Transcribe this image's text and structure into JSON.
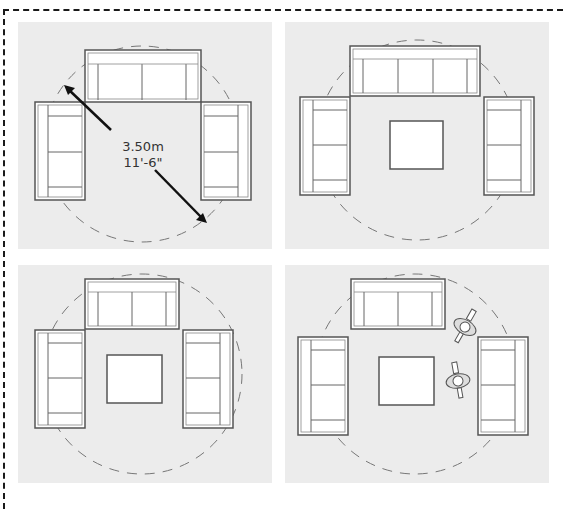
{
  "diagram": {
    "colors": {
      "panel_bg": "#ececec",
      "furniture_fill": "#ffffff",
      "furniture_stroke": "#555555",
      "circle_stroke": "#777777",
      "arrow": "#111111"
    },
    "panels": [
      {
        "id": "layout-1",
        "description": "Sofa with two side sofas, conversation circle with diameter dimension",
        "has_table": false,
        "has_people": false
      },
      {
        "id": "layout-2",
        "description": "Three-seat sofa, two side sofas, square coffee table",
        "has_table": true,
        "has_people": false
      },
      {
        "id": "layout-3",
        "description": "Two-seat sofa, two side sofas, square coffee table",
        "has_table": true,
        "has_people": true
      },
      {
        "id": "layout-4",
        "description": "Sofa, two side sofas offset, coffee table, two people walking through",
        "has_table": true,
        "has_people": true
      }
    ],
    "dimension": {
      "metric": "3.50m",
      "imperial": "11'-6\""
    }
  }
}
